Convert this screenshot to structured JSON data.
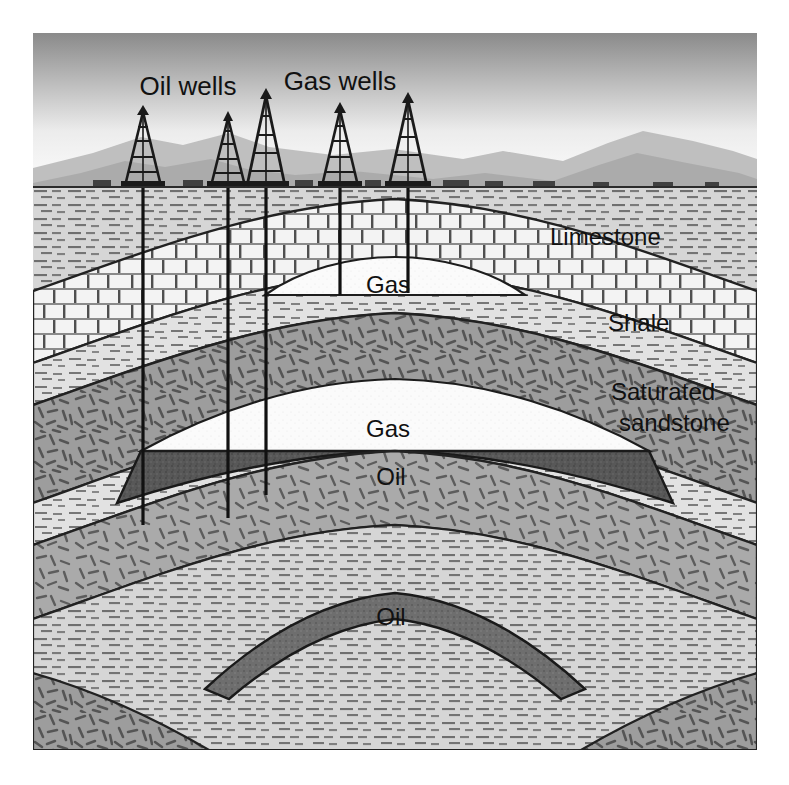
{
  "figure": {
    "kind": "geological-cross-section",
    "canvas": {
      "width": 789,
      "height": 785
    },
    "frame": {
      "x": 33,
      "y": 33,
      "width": 724,
      "height": 717
    }
  },
  "labels": {
    "oil_wells": "Oil wells",
    "gas_wells": "Gas wells",
    "limestone": "Limestone",
    "shale": "Shale",
    "saturated_line1": "Saturated",
    "saturated_line2": "sandstone",
    "gas_upper": "Gas",
    "gas_middle": "Gas",
    "oil_middle": "Oil",
    "oil_lower": "Oil"
  },
  "label_positions": {
    "oil_wells": {
      "x": 155,
      "y": 55
    },
    "gas_wells": {
      "x": 307,
      "y": 50
    },
    "limestone": {
      "x": 517,
      "y": 206
    },
    "shale": {
      "x": 575,
      "y": 292
    },
    "saturated_line1": {
      "x": 578,
      "y": 361
    },
    "saturated_line2": {
      "x": 578,
      "y": 392
    },
    "gas_upper": {
      "x": 355,
      "y": 254
    },
    "gas_middle": {
      "x": 355,
      "y": 398
    },
    "oil_middle": {
      "x": 358,
      "y": 446
    },
    "oil_lower": {
      "x": 358,
      "y": 586
    }
  },
  "colors": {
    "sky_top": "#8d8d8d",
    "sky_bottom": "#fdfdfd",
    "mountain_far": "#b9b9b9",
    "mountain_near": "#a8a8a8",
    "ground_line": "#2b2b2b",
    "shale_fill": "#d4d4d4",
    "limestone_fill": "#f2f2f2",
    "sandstone_fill": "#9a9a9a",
    "gas_fill": "#fbfbfb",
    "oil_fill": "#5a5a5a",
    "oil_lower_fill": "#6d6d6d",
    "stroke": "#222222",
    "derrick": "#1a1a1a",
    "wellbore": "#111111",
    "text": "#111111"
  },
  "strata": [
    {
      "name": "shale",
      "label": "Shale",
      "pattern": "horizontal-dashes"
    },
    {
      "name": "limestone",
      "label": "Limestone",
      "pattern": "brick"
    },
    {
      "name": "saturated-sandstone",
      "label": "Saturated sandstone",
      "pattern": "scattered-ticks"
    }
  ],
  "fluids": [
    {
      "name": "gas-upper",
      "label": "Gas",
      "trap": 1,
      "phase": "gas"
    },
    {
      "name": "gas-middle",
      "label": "Gas",
      "trap": 2,
      "phase": "gas"
    },
    {
      "name": "oil-middle",
      "label": "Oil",
      "trap": 2,
      "phase": "oil"
    },
    {
      "name": "oil-lower",
      "label": "Oil",
      "trap": 3,
      "phase": "oil"
    }
  ],
  "wells": [
    {
      "id": 1,
      "kind": "oil",
      "surface_x": 110,
      "derrick_height": 72,
      "bottom_y": 492
    },
    {
      "id": 2,
      "kind": "oil",
      "surface_x": 195,
      "derrick_height": 68,
      "bottom_y": 485
    },
    {
      "id": 3,
      "kind": "oil",
      "surface_x": 233,
      "derrick_height": 88,
      "bottom_y": 462
    },
    {
      "id": 4,
      "kind": "gas",
      "surface_x": 307,
      "derrick_height": 76,
      "bottom_y": 262
    },
    {
      "id": 5,
      "kind": "gas",
      "surface_x": 375,
      "derrick_height": 84,
      "bottom_y": 260
    }
  ],
  "ground": {
    "surface_y": 155
  },
  "well_groups": {
    "oil": {
      "count": 3,
      "label": "Oil wells"
    },
    "gas": {
      "count": 2,
      "label": "Gas wells"
    }
  }
}
